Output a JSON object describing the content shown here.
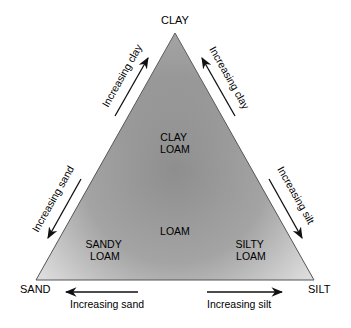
{
  "vertices": {
    "top": "CLAY",
    "left": "SAND",
    "right": "SILT"
  },
  "zones": {
    "clay_loam": [
      "CLAY",
      "LOAM"
    ],
    "loam": "LOAM",
    "sandy_loam": [
      "SANDY",
      "LOAM"
    ],
    "silty_loam": [
      "SILTY",
      "LOAM"
    ]
  },
  "arrows": {
    "left_edge_upper": "Increasing clay",
    "right_edge_upper": "Increasing clay",
    "left_edge_lower": "Increasing sand",
    "right_edge_lower": "Increasing silt",
    "bottom_left": "Increasing sand",
    "bottom_right": "Increasing silt"
  },
  "colors": {
    "triangle_dark": "#8c8c8c",
    "triangle_light": "#d8d8d8",
    "edge": "#555555",
    "arrow": "#111111"
  }
}
